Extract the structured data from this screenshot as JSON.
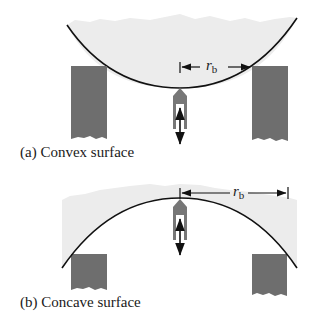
{
  "panels": [
    {
      "id": "a",
      "caption": "(a) Convex surface",
      "dimension_label": "r",
      "dimension_subscript": "b"
    },
    {
      "id": "b",
      "caption": "(b) Concave surface",
      "dimension_label": "r",
      "dimension_subscript": "b"
    }
  ],
  "colors": {
    "sample_fill": "#ececec",
    "support_fill": "#6e6e6e",
    "probe_fill": "#777777",
    "line": "#111111"
  }
}
